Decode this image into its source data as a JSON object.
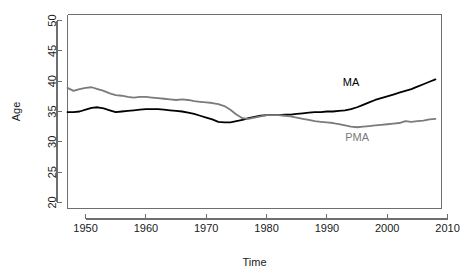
{
  "chart_data": {
    "type": "line",
    "title": "",
    "xlabel": "Time",
    "ylabel": "Age",
    "xlim": [
      1947,
      2009
    ],
    "ylim": [
      19,
      51
    ],
    "grid": false,
    "legend_position": "inline-annotation",
    "x_ticks": [
      1950,
      1960,
      1970,
      1980,
      1990,
      2000,
      2010
    ],
    "x_tick_labels": [
      "1950",
      "1960",
      "1970",
      "1980",
      "1990",
      "2000",
      "2010"
    ],
    "y_ticks": [
      20,
      25,
      30,
      35,
      40,
      45,
      50
    ],
    "y_tick_labels": [
      "20",
      "25",
      "30",
      "35",
      "40",
      "45",
      "50"
    ],
    "x": [
      1947,
      1948,
      1949,
      1950,
      1951,
      1952,
      1953,
      1954,
      1955,
      1956,
      1957,
      1958,
      1959,
      1960,
      1961,
      1962,
      1963,
      1964,
      1965,
      1966,
      1967,
      1968,
      1969,
      1970,
      1971,
      1972,
      1973,
      1974,
      1975,
      1976,
      1977,
      1978,
      1979,
      1980,
      1981,
      1982,
      1983,
      1984,
      1985,
      1986,
      1987,
      1988,
      1989,
      1990,
      1991,
      1992,
      1993,
      1994,
      1995,
      1996,
      1997,
      1998,
      1999,
      2000,
      2001,
      2002,
      2003,
      2004,
      2005,
      2006,
      2007,
      2008
    ],
    "series": [
      {
        "name": "MA",
        "color": "#000000",
        "label_x": 1994,
        "label_y": 39.2,
        "values": [
          34.9,
          34.9,
          35.0,
          35.3,
          35.6,
          35.7,
          35.5,
          35.2,
          34.9,
          35.0,
          35.1,
          35.2,
          35.3,
          35.4,
          35.4,
          35.4,
          35.3,
          35.2,
          35.1,
          35.0,
          34.8,
          34.6,
          34.3,
          34.0,
          33.7,
          33.3,
          33.2,
          33.2,
          33.4,
          33.6,
          33.9,
          34.1,
          34.3,
          34.4,
          34.4,
          34.4,
          34.5,
          34.5,
          34.6,
          34.7,
          34.8,
          34.9,
          34.9,
          35.0,
          35.0,
          35.1,
          35.2,
          35.4,
          35.7,
          36.1,
          36.5,
          36.9,
          37.2,
          37.5,
          37.8,
          38.1,
          38.4,
          38.7,
          39.1,
          39.5,
          39.9,
          40.3
        ]
      },
      {
        "name": "PMA",
        "color": "#7b7b7b",
        "label_x": 1995,
        "label_y": 30.2,
        "values": [
          38.9,
          38.4,
          38.7,
          38.9,
          39.0,
          38.7,
          38.4,
          38.0,
          37.7,
          37.6,
          37.4,
          37.3,
          37.4,
          37.4,
          37.3,
          37.2,
          37.1,
          37.0,
          36.9,
          37.0,
          36.9,
          36.7,
          36.6,
          36.5,
          36.4,
          36.2,
          35.9,
          35.3,
          34.5,
          33.9,
          33.8,
          34.0,
          34.2,
          34.4,
          34.4,
          34.4,
          34.3,
          34.2,
          34.0,
          33.8,
          33.6,
          33.4,
          33.3,
          33.2,
          33.1,
          32.9,
          32.7,
          32.5,
          32.4,
          32.5,
          32.6,
          32.7,
          32.8,
          32.9,
          33.0,
          33.1,
          33.4,
          33.3,
          33.4,
          33.5,
          33.7,
          33.8
        ]
      }
    ]
  }
}
